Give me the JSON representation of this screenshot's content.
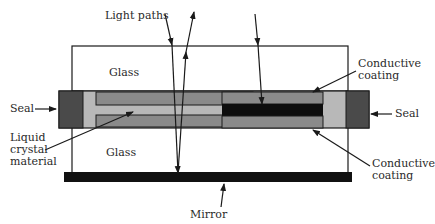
{
  "diagram": {
    "labels": {
      "light_paths": "Light paths",
      "glass_top": "Glass",
      "glass_bottom": "Glass",
      "seal_left": "Seal",
      "seal_right": "Seal",
      "conductive_top_1": "Conductive",
      "conductive_top_2": "coating",
      "conductive_bottom_1": "Conductive",
      "conductive_bottom_2": "coating",
      "liquid_1": "Liquid",
      "liquid_2": "crystal",
      "liquid_3": "material",
      "mirror": "Mirror"
    },
    "colors": {
      "seal": "#4a4a4a",
      "fill": "#b8b8b8",
      "electrode": "#8a8a8a",
      "liquid_crystal_active": "#0d0d0d",
      "mirror": "#111111",
      "line": "#1a1a1a"
    }
  }
}
